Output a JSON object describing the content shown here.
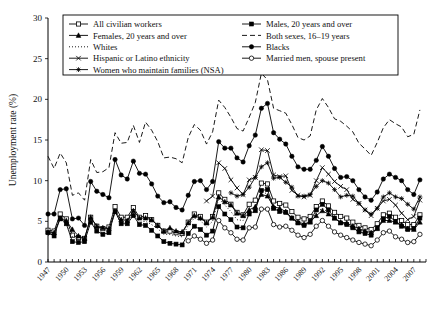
{
  "chart_data": {
    "type": "line",
    "title": "",
    "xlabel": "",
    "ylabel": "Unemployment rate (%)",
    "ylim": [
      0,
      30
    ],
    "yticks": [
      0,
      5,
      10,
      15,
      20,
      25,
      30
    ],
    "xlim": [
      1947,
      2009
    ],
    "xticks": [
      1947,
      1950,
      1953,
      1956,
      1959,
      1962,
      1965,
      1968,
      1971,
      1974,
      1977,
      1980,
      1983,
      1986,
      1989,
      1992,
      1995,
      1998,
      2001,
      2004,
      2007
    ],
    "grid": false,
    "legend_position": "top-inside",
    "x": [
      1947,
      1948,
      1949,
      1950,
      1951,
      1952,
      1953,
      1954,
      1955,
      1956,
      1957,
      1958,
      1959,
      1960,
      1961,
      1962,
      1963,
      1964,
      1965,
      1966,
      1967,
      1968,
      1969,
      1970,
      1971,
      1972,
      1973,
      1974,
      1975,
      1976,
      1977,
      1978,
      1979,
      1980,
      1981,
      1982,
      1983,
      1984,
      1985,
      1986,
      1987,
      1988,
      1989,
      1990,
      1991,
      1992,
      1993,
      1994,
      1995,
      1996,
      1997,
      1998,
      1999,
      2000,
      2001,
      2002,
      2003,
      2004,
      2005,
      2006,
      2007,
      2008
    ],
    "series": [
      {
        "name": "All civilian workers",
        "marker": "open-square",
        "line": "solid",
        "values": [
          3.9,
          3.8,
          5.9,
          5.3,
          3.3,
          3.0,
          2.9,
          5.5,
          4.4,
          4.1,
          4.3,
          6.8,
          5.5,
          5.5,
          6.7,
          5.5,
          5.7,
          5.2,
          4.5,
          3.8,
          3.8,
          3.6,
          3.5,
          4.9,
          5.9,
          5.6,
          4.9,
          5.6,
          8.5,
          7.7,
          7.1,
          6.1,
          5.8,
          7.1,
          7.6,
          9.7,
          9.6,
          7.5,
          7.2,
          7.0,
          6.2,
          5.5,
          5.3,
          5.6,
          6.8,
          7.5,
          6.9,
          6.1,
          5.6,
          5.4,
          4.9,
          4.5,
          4.2,
          4.0,
          4.7,
          5.8,
          6.0,
          5.5,
          5.1,
          4.6,
          4.6,
          5.8
        ]
      },
      {
        "name": "Males, 20 years and over",
        "marker": "filled-square",
        "line": "solid",
        "values": [
          3.6,
          3.2,
          5.4,
          4.7,
          2.5,
          2.4,
          2.5,
          4.9,
          3.8,
          3.4,
          3.6,
          6.2,
          4.7,
          4.7,
          5.7,
          4.6,
          4.5,
          3.9,
          3.2,
          2.5,
          2.3,
          2.2,
          2.1,
          3.5,
          4.4,
          4.0,
          3.3,
          3.8,
          6.8,
          5.9,
          5.2,
          4.3,
          4.2,
          5.9,
          6.3,
          8.8,
          8.9,
          6.6,
          6.2,
          6.1,
          5.4,
          4.8,
          4.5,
          5.0,
          6.4,
          7.1,
          6.4,
          5.4,
          4.8,
          4.6,
          4.2,
          3.7,
          3.5,
          3.3,
          4.2,
          5.3,
          5.6,
          5.0,
          4.4,
          4.0,
          4.1,
          5.4
        ]
      },
      {
        "name": "Females, 20 years and over",
        "marker": "filled-triangle",
        "line": "solid",
        "values": [
          3.7,
          3.6,
          5.3,
          5.1,
          4.0,
          3.2,
          2.9,
          5.5,
          4.4,
          4.2,
          4.1,
          6.2,
          5.2,
          5.1,
          6.3,
          5.4,
          5.4,
          5.2,
          4.5,
          3.8,
          4.2,
          3.8,
          3.7,
          4.8,
          5.7,
          5.4,
          4.8,
          5.5,
          8.0,
          7.4,
          7.0,
          6.0,
          5.7,
          6.4,
          6.8,
          8.3,
          8.1,
          6.8,
          6.6,
          6.2,
          5.4,
          4.9,
          4.7,
          4.9,
          5.7,
          6.3,
          5.9,
          5.4,
          4.9,
          4.8,
          4.4,
          4.1,
          3.8,
          3.6,
          4.1,
          5.1,
          5.1,
          4.9,
          4.6,
          4.1,
          4.0,
          4.9
        ]
      },
      {
        "name": "Both sexes, 16–19 years",
        "marker": "none",
        "line": "dashed",
        "values": [
          13.0,
          11.5,
          13.4,
          12.2,
          8.2,
          8.5,
          7.6,
          12.6,
          11.0,
          11.1,
          11.6,
          15.9,
          14.6,
          14.7,
          16.8,
          14.7,
          17.2,
          16.2,
          14.8,
          12.8,
          12.9,
          12.7,
          12.2,
          15.3,
          16.9,
          16.2,
          14.5,
          16.0,
          19.9,
          19.0,
          17.8,
          16.4,
          16.1,
          17.8,
          19.6,
          23.2,
          22.4,
          18.9,
          18.6,
          18.3,
          16.9,
          15.3,
          15.0,
          15.5,
          18.7,
          20.1,
          19.0,
          17.6,
          17.3,
          16.7,
          16.0,
          14.6,
          13.9,
          13.1,
          14.7,
          16.5,
          17.5,
          17.0,
          16.6,
          15.4,
          15.7,
          18.7
        ]
      },
      {
        "name": "Whites",
        "marker": "none",
        "line": "dotted",
        "values": [
          3.3,
          3.5,
          5.6,
          4.9,
          3.1,
          2.8,
          2.7,
          5.0,
          3.9,
          3.6,
          3.8,
          6.1,
          4.8,
          5.0,
          6.0,
          4.9,
          5.0,
          4.6,
          4.1,
          3.4,
          3.4,
          3.2,
          3.1,
          4.5,
          5.4,
          5.1,
          4.3,
          5.0,
          7.8,
          7.0,
          6.2,
          5.2,
          5.1,
          6.3,
          6.7,
          8.6,
          8.4,
          6.5,
          6.2,
          6.0,
          5.3,
          4.7,
          4.5,
          4.8,
          6.1,
          6.6,
          6.1,
          5.3,
          4.9,
          4.7,
          4.2,
          3.9,
          3.7,
          3.5,
          4.2,
          5.1,
          5.2,
          4.8,
          4.4,
          4.0,
          4.1,
          5.2
        ]
      },
      {
        "name": "Blacks",
        "marker": "filled-circle",
        "line": "solid",
        "values": [
          5.9,
          5.9,
          8.9,
          9.0,
          5.3,
          5.4,
          4.5,
          9.9,
          8.7,
          8.3,
          7.9,
          12.6,
          10.7,
          10.2,
          12.4,
          10.9,
          10.8,
          9.6,
          8.1,
          7.3,
          7.4,
          6.7,
          6.4,
          8.2,
          9.9,
          10.0,
          8.9,
          9.9,
          14.8,
          14.0,
          14.0,
          12.8,
          12.3,
          14.3,
          15.6,
          18.9,
          19.5,
          15.9,
          15.1,
          14.5,
          13.0,
          11.7,
          11.4,
          11.4,
          12.5,
          14.2,
          13.0,
          11.5,
          10.4,
          10.5,
          10.0,
          8.9,
          8.0,
          7.6,
          8.6,
          10.2,
          10.8,
          10.4,
          10.0,
          8.9,
          8.3,
          10.1
        ]
      },
      {
        "name": "Hispanic or Latino ethnicity",
        "marker": "x-cross",
        "line": "solid",
        "values": [
          null,
          null,
          null,
          null,
          null,
          null,
          null,
          null,
          null,
          null,
          null,
          null,
          null,
          null,
          null,
          null,
          null,
          null,
          null,
          null,
          null,
          null,
          null,
          null,
          null,
          null,
          7.5,
          8.1,
          12.2,
          11.5,
          10.1,
          9.1,
          8.3,
          10.1,
          10.4,
          13.8,
          13.7,
          10.7,
          10.5,
          10.6,
          8.8,
          8.2,
          8.0,
          8.2,
          10.0,
          11.6,
          10.8,
          9.9,
          9.3,
          8.9,
          7.7,
          7.2,
          6.4,
          5.7,
          6.6,
          7.5,
          7.7,
          7.0,
          6.0,
          5.2,
          5.6,
          7.6
        ]
      },
      {
        "name": "Married men, spouse present",
        "marker": "open-circle",
        "line": "solid",
        "values": [
          null,
          null,
          null,
          null,
          null,
          null,
          null,
          null,
          null,
          null,
          null,
          null,
          null,
          null,
          null,
          null,
          null,
          null,
          null,
          null,
          null,
          null,
          null,
          null,
          null,
          null,
          null,
          null,
          null,
          null,
          null,
          null,
          null,
          null,
          null,
          null,
          null,
          null,
          null,
          null,
          null,
          null,
          null,
          null,
          null,
          null,
          null,
          null,
          null,
          null,
          null,
          null,
          null,
          null,
          null,
          null,
          null,
          null,
          null,
          null,
          null,
          null
        ]
      },
      {
        "name": "Women who maintain families (NSA)",
        "marker": "star-cross",
        "line": "solid",
        "values": [
          null,
          null,
          null,
          null,
          null,
          null,
          null,
          null,
          null,
          null,
          null,
          null,
          null,
          null,
          null,
          null,
          null,
          null,
          null,
          null,
          null,
          null,
          null,
          null,
          null,
          null,
          null,
          null,
          null,
          null,
          null,
          null,
          null,
          null,
          null,
          null,
          null,
          null,
          null,
          null,
          null,
          null,
          null,
          null,
          null,
          null,
          null,
          null,
          null,
          null,
          null,
          null,
          null,
          null,
          null,
          null,
          null,
          null,
          null,
          null,
          null,
          null
        ]
      }
    ],
    "series_married_men": {
      "name": "Married men, spouse present",
      "x": [
        1947,
        1948,
        1949,
        1950,
        1951,
        1952,
        1953,
        1954,
        1955,
        1956,
        1957,
        1958,
        1959,
        1960,
        1961,
        1962,
        1963,
        1964,
        1965,
        1966,
        1967,
        1968,
        1969,
        1970,
        1971,
        1972,
        1973,
        1974,
        1975,
        1976,
        1977,
        1978,
        1979,
        1980,
        1981,
        1982,
        1983,
        1984,
        1985,
        1986,
        1987,
        1988,
        1989,
        1990,
        1991,
        1992,
        1993,
        1994,
        1995,
        1996,
        1997,
        1998,
        1999,
        2000,
        2001,
        2002,
        2003,
        2004,
        2005,
        2006,
        2007,
        2008
      ],
      "values": [
        null,
        null,
        null,
        null,
        null,
        null,
        null,
        null,
        null,
        null,
        null,
        null,
        null,
        null,
        null,
        null,
        null,
        null,
        null,
        null,
        null,
        null,
        null,
        2.6,
        3.2,
        2.8,
        2.3,
        2.7,
        5.1,
        4.2,
        3.6,
        2.8,
        2.7,
        4.2,
        4.3,
        6.5,
        6.5,
        4.6,
        4.3,
        4.4,
        3.9,
        3.3,
        3.0,
        3.4,
        4.4,
        5.1,
        4.4,
        3.7,
        3.3,
        3.0,
        2.7,
        2.4,
        2.2,
        2.0,
        2.7,
        3.6,
        3.8,
        3.1,
        2.8,
        2.4,
        2.5,
        3.4
      ]
    },
    "series_women_families": {
      "name": "Women who maintain families (NSA)",
      "x": [
        1947,
        1948,
        1949,
        1950,
        1951,
        1952,
        1953,
        1954,
        1955,
        1956,
        1957,
        1958,
        1959,
        1960,
        1961,
        1962,
        1963,
        1964,
        1965,
        1966,
        1967,
        1968,
        1969,
        1970,
        1971,
        1972,
        1973,
        1974,
        1975,
        1976,
        1977,
        1978,
        1979,
        1980,
        1981,
        1982,
        1983,
        1984,
        1985,
        1986,
        1987,
        1988,
        1989,
        1990,
        1991,
        1992,
        1993,
        1994,
        1995,
        1996,
        1997,
        1998,
        1999,
        2000,
        2001,
        2002,
        2003,
        2004,
        2005,
        2006,
        2007,
        2008
      ],
      "values": [
        null,
        null,
        null,
        null,
        null,
        null,
        null,
        null,
        null,
        null,
        null,
        null,
        null,
        null,
        null,
        null,
        null,
        null,
        null,
        null,
        null,
        null,
        null,
        null,
        null,
        null,
        null,
        null,
        null,
        null,
        8.5,
        8.1,
        8.3,
        9.2,
        10.4,
        11.7,
        12.2,
        10.3,
        10.4,
        9.8,
        9.2,
        8.1,
        8.1,
        8.3,
        9.3,
        10.0,
        9.7,
        8.9,
        8.0,
        8.2,
        8.1,
        7.2,
        6.4,
        5.9,
        6.6,
        8.0,
        8.5,
        8.0,
        7.8,
        7.1,
        6.5,
        8.0
      ]
    }
  },
  "legend": {
    "entries_left": [
      {
        "label": "All civilian workers",
        "marker": "open-square",
        "line": "solid"
      },
      {
        "label": "Females, 20 years and over",
        "marker": "filled-triangle",
        "line": "solid"
      },
      {
        "label": "Whites",
        "marker": "none",
        "line": "dotted"
      },
      {
        "label": "Hispanic or Latino ethnicity",
        "marker": "plus-cross",
        "line": "solid"
      },
      {
        "label": "Women who maintain families (NSA)",
        "marker": "star-cross",
        "line": "solid"
      }
    ],
    "entries_right": [
      {
        "label": "Males, 20 years and over",
        "marker": "filled-square",
        "line": "solid"
      },
      {
        "label": "Both sexes, 16–19 years",
        "marker": "none",
        "line": "dashed"
      },
      {
        "label": "Blacks",
        "marker": "filled-circle",
        "line": "solid"
      },
      {
        "label": "Married men, spouse present",
        "marker": "open-circle",
        "line": "solid"
      }
    ]
  },
  "colors": {
    "ink": "#000000",
    "background": "#ffffff"
  }
}
